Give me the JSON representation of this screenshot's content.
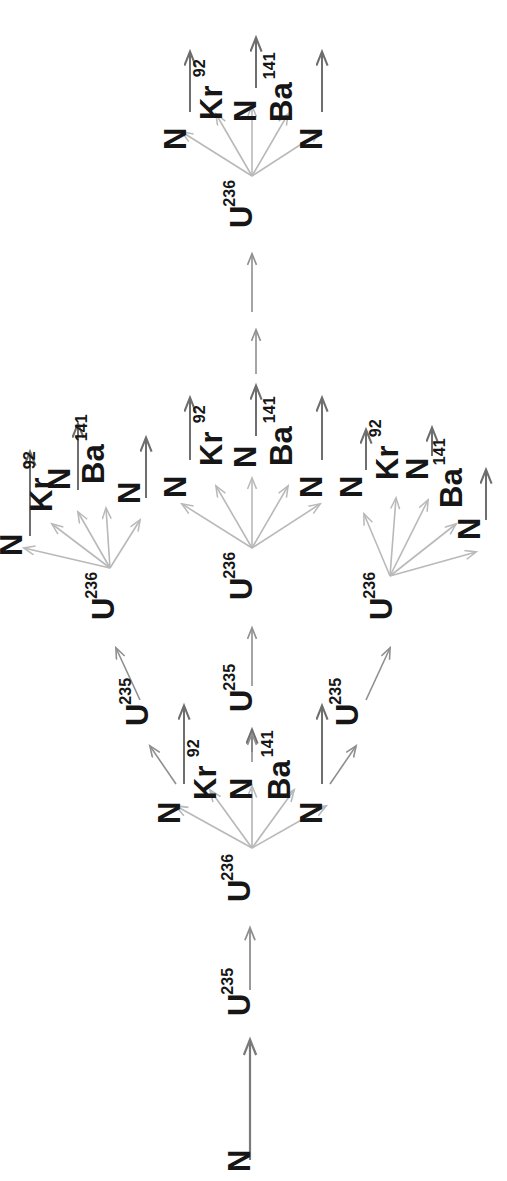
{
  "diagram": {
    "orientation_deg": 90,
    "background": "#ffffff",
    "colors": {
      "label_text": "#161616",
      "fission_arrow": "#b9b9b9",
      "product_arrow": "#6e6e6e",
      "chain_arrow": "#8f8f8f",
      "seed_arrow": "#7a7a7a"
    },
    "species": {
      "neutron": "N",
      "u235": "U",
      "u235_sup": "235",
      "u236": "U",
      "u236_sup": "236",
      "kr": "Kr",
      "kr_sup": "92",
      "ba": "Ba",
      "ba_sup": "141"
    },
    "generations": 3,
    "products_per_fission": 5,
    "product_sequence": [
      "N",
      "Kr",
      "N",
      "Ba",
      "N"
    ],
    "nodes": [
      {
        "id": "n-seed",
        "kind": "neutron",
        "label": "N",
        "sup": "",
        "x": 250,
        "y": 1172,
        "rot": -90
      },
      {
        "id": "u235-g0",
        "kind": "u235",
        "label": "U",
        "sup": "235",
        "x": 250,
        "y": 1016,
        "rot": -90
      },
      {
        "id": "u236-g1",
        "kind": "u236",
        "label": "U",
        "sup": "236",
        "x": 250,
        "y": 902,
        "rot": -90
      },
      {
        "id": "p1-n-a",
        "kind": "neutron",
        "label": "N",
        "sup": "",
        "x": 180,
        "y": 824,
        "rot": -90
      },
      {
        "id": "p1-kr",
        "kind": "kr",
        "label": "Kr",
        "sup": "92",
        "x": 216,
        "y": 800,
        "rot": -90
      },
      {
        "id": "p1-n-b",
        "kind": "neutron",
        "label": "N",
        "sup": "",
        "x": 252,
        "y": 800,
        "rot": -90
      },
      {
        "id": "p1-ba",
        "kind": "ba",
        "label": "Ba",
        "sup": "141",
        "x": 290,
        "y": 800,
        "rot": -90
      },
      {
        "id": "p1-n-c",
        "kind": "neutron",
        "label": "N",
        "sup": "",
        "x": 322,
        "y": 824,
        "rot": -90
      },
      {
        "id": "u235-L",
        "kind": "u235",
        "label": "U",
        "sup": "235",
        "x": 148,
        "y": 726,
        "rot": -90
      },
      {
        "id": "u235-M",
        "kind": "u235",
        "label": "U",
        "sup": "235",
        "x": 252,
        "y": 712,
        "rot": -90
      },
      {
        "id": "u235-R",
        "kind": "u235",
        "label": "U",
        "sup": "235",
        "x": 358,
        "y": 726,
        "rot": -90
      },
      {
        "id": "u236-L",
        "kind": "u236",
        "label": "U",
        "sup": "236",
        "x": 114,
        "y": 620,
        "rot": -90
      },
      {
        "id": "u236-M",
        "kind": "u236",
        "label": "U",
        "sup": "236",
        "x": 252,
        "y": 600,
        "rot": -90
      },
      {
        "id": "u236-R",
        "kind": "u236",
        "label": "U",
        "sup": "236",
        "x": 392,
        "y": 620,
        "rot": -90
      },
      {
        "id": "L-n-a",
        "kind": "neutron",
        "label": "N",
        "sup": "",
        "x": 22,
        "y": 556,
        "rot": -90
      },
      {
        "id": "L-kr",
        "kind": "kr",
        "label": "Kr",
        "sup": "92",
        "x": 52,
        "y": 512,
        "rot": -90
      },
      {
        "id": "L-n-b",
        "kind": "neutron",
        "label": "N",
        "sup": "",
        "x": 70,
        "y": 490,
        "rot": -90
      },
      {
        "id": "L-ba",
        "kind": "ba",
        "label": "Ba",
        "sup": "141",
        "x": 104,
        "y": 484,
        "rot": -90
      },
      {
        "id": "L-n-c",
        "kind": "neutron",
        "label": "N",
        "sup": "",
        "x": 140,
        "y": 504,
        "rot": -90
      },
      {
        "id": "M-n-a",
        "kind": "neutron",
        "label": "N",
        "sup": "",
        "x": 186,
        "y": 498,
        "rot": -90
      },
      {
        "id": "M-kr",
        "kind": "kr",
        "label": "Kr",
        "sup": "92",
        "x": 222,
        "y": 466,
        "rot": -90
      },
      {
        "id": "M-n-b",
        "kind": "neutron",
        "label": "N",
        "sup": "",
        "x": 256,
        "y": 468,
        "rot": -90
      },
      {
        "id": "M-ba",
        "kind": "ba",
        "label": "Ba",
        "sup": "141",
        "x": 292,
        "y": 466,
        "rot": -90
      },
      {
        "id": "M-n-c",
        "kind": "neutron",
        "label": "N",
        "sup": "",
        "x": 322,
        "y": 498,
        "rot": -90
      },
      {
        "id": "R-n-a",
        "kind": "neutron",
        "label": "N",
        "sup": "",
        "x": 362,
        "y": 498,
        "rot": -90
      },
      {
        "id": "R-kr",
        "kind": "kr",
        "label": "Kr",
        "sup": "92",
        "x": 398,
        "y": 480,
        "rot": -90
      },
      {
        "id": "R-n-b",
        "kind": "neutron",
        "label": "N",
        "sup": "",
        "x": 428,
        "y": 480,
        "rot": -90
      },
      {
        "id": "R-ba",
        "kind": "ba",
        "label": "Ba",
        "sup": "141",
        "x": 462,
        "y": 508,
        "rot": -90
      },
      {
        "id": "R-n-c",
        "kind": "neutron",
        "label": "N",
        "sup": "",
        "x": 480,
        "y": 540,
        "rot": -90
      },
      {
        "id": "top-u236",
        "kind": "u236",
        "label": "U",
        "sup": "236",
        "x": 252,
        "y": 228,
        "rot": -90
      },
      {
        "id": "T-n-a",
        "kind": "neutron",
        "label": "N",
        "sup": "",
        "x": 186,
        "y": 150,
        "rot": -90
      },
      {
        "id": "T-kr",
        "kind": "kr",
        "label": "Kr",
        "sup": "92",
        "x": 222,
        "y": 120,
        "rot": -90
      },
      {
        "id": "T-n-b",
        "kind": "neutron",
        "label": "N",
        "sup": "",
        "x": 256,
        "y": 122,
        "rot": -90
      },
      {
        "id": "T-ba",
        "kind": "ba",
        "label": "Ba",
        "sup": "141",
        "x": 292,
        "y": 122,
        "rot": -90
      },
      {
        "id": "T-n-c",
        "kind": "neutron",
        "label": "N",
        "sup": "",
        "x": 322,
        "y": 150,
        "rot": -90
      }
    ]
  }
}
